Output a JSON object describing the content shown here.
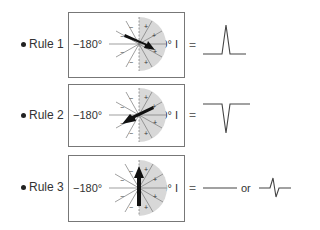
{
  "figure": {
    "rules": [
      {
        "label": "Rule 1",
        "left_angle": "−180°",
        "right_angle": "0° I",
        "equals": "=",
        "arrow_direction": "lower-right toward positive",
        "waveform": "upright-deflection"
      },
      {
        "label": "Rule 2",
        "left_angle": "−180°",
        "right_angle": "0° I",
        "equals": "=",
        "arrow_direction": "lower-left toward negative",
        "waveform": "inverted-deflection"
      },
      {
        "label": "Rule 3",
        "left_angle": "−180°",
        "right_angle": "0° I",
        "equals": "=",
        "arrow_direction": "vertical perpendicular",
        "waveform": "flat-line",
        "or_text": "or",
        "alt_waveform": "biphasic-deflection"
      }
    ],
    "colors": {
      "shade": "#d4d4d4",
      "arrow": "#111111",
      "line": "#555555",
      "border": "#777777"
    }
  }
}
